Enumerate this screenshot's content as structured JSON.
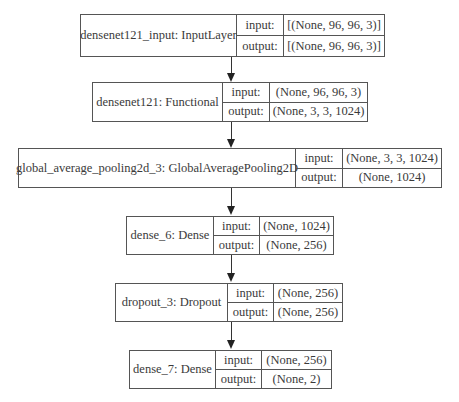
{
  "diagram": {
    "type": "keras-model-plot",
    "io_labels": {
      "input": "input:",
      "output": "output:"
    },
    "nodes": [
      {
        "name": "densenet121_input: InputLayer",
        "input": "[(None, 96, 96, 3)]",
        "output": "[(None, 96, 96, 3)]"
      },
      {
        "name": "densenet121: Functional",
        "input": "(None, 96, 96, 3)",
        "output": "(None, 3, 3, 1024)"
      },
      {
        "name": "global_average_pooling2d_3: GlobalAveragePooling2D",
        "input": "(None, 3, 3, 1024)",
        "output": "(None, 1024)"
      },
      {
        "name": "dense_6: Dense",
        "input": "(None, 1024)",
        "output": "(None, 256)"
      },
      {
        "name": "dropout_3: Dropout",
        "input": "(None, 256)",
        "output": "(None, 256)"
      },
      {
        "name": "dense_7: Dense",
        "input": "(None, 256)",
        "output": "(None, 2)"
      }
    ],
    "edges": [
      {
        "from": 0,
        "to": 1
      },
      {
        "from": 1,
        "to": 2
      },
      {
        "from": 2,
        "to": 3
      },
      {
        "from": 3,
        "to": 4
      },
      {
        "from": 4,
        "to": 5
      }
    ]
  }
}
